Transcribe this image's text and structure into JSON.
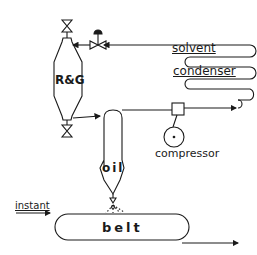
{
  "diagram": {
    "type": "process-flow",
    "labels": {
      "vessel": "R&G",
      "solvent": "solvent",
      "condenser": "condenser",
      "compressor": "compressor",
      "oil": "oil",
      "instant": "instant",
      "belt": "belt"
    },
    "components": [
      {
        "id": "rg-vessel",
        "label": "R&G",
        "shape": "tapered-vessel"
      },
      {
        "id": "top-valve",
        "shape": "gate-valve"
      },
      {
        "id": "bottom-valve",
        "shape": "gate-valve"
      },
      {
        "id": "control-valve",
        "shape": "control-valve"
      },
      {
        "id": "solvent-condenser",
        "label": "solvent condenser",
        "shape": "serpentine-coil"
      },
      {
        "id": "compressor",
        "label": "compressor",
        "shape": "circle"
      },
      {
        "id": "junction-box",
        "shape": "square"
      },
      {
        "id": "oil-separator",
        "label": "oil",
        "shape": "vessel-with-nozzle"
      },
      {
        "id": "belt",
        "label": "belt",
        "shape": "rounded-rect"
      }
    ],
    "flows": [
      {
        "from": "solvent-condenser",
        "to": "control-valve"
      },
      {
        "from": "control-valve",
        "to": "rg-vessel"
      },
      {
        "from": "rg-vessel",
        "to": "oil-separator"
      },
      {
        "from": "oil-separator",
        "to": "junction-box"
      },
      {
        "from": "junction-box",
        "to": "solvent-condenser"
      },
      {
        "from": "oil-separator",
        "to": "belt",
        "note": "spray"
      },
      {
        "from": "instant",
        "to": "belt"
      },
      {
        "from": "belt",
        "to": "output"
      }
    ],
    "colors": {
      "stroke": "#1a1a1a",
      "background": "#ffffff"
    }
  }
}
